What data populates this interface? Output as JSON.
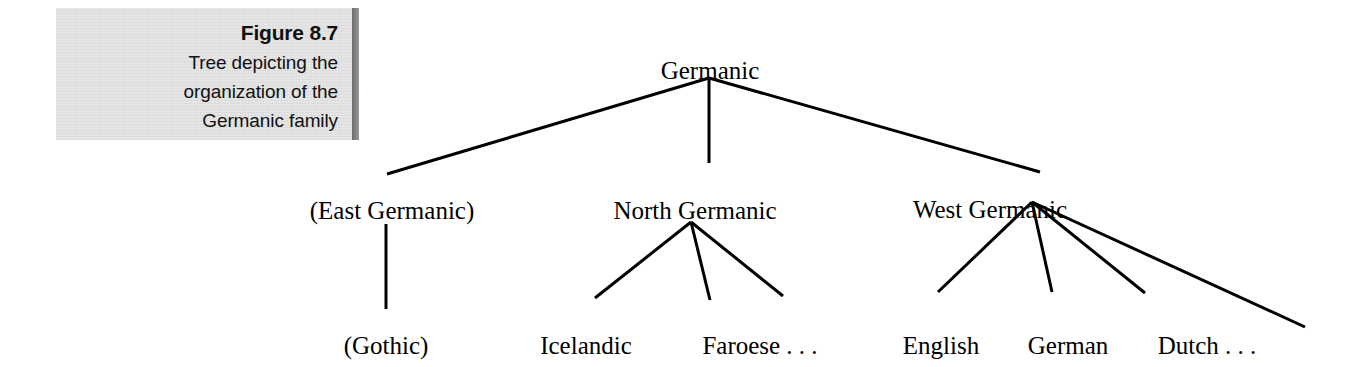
{
  "figure": {
    "caption": {
      "title": "Figure 8.7",
      "lines": [
        "Tree depicting the",
        "organization of the",
        "Germanic family"
      ],
      "panel_color": "#e6e6e6",
      "shadow_color": "#6d6d6d"
    },
    "tree": {
      "line_color": "#000000",
      "text_color": "#000000",
      "nodes": [
        {
          "id": "germanic",
          "label": "Germanic",
          "x": 710,
          "y": 58,
          "level": 0
        },
        {
          "id": "east-germanic",
          "label": "(East Germanic)",
          "x": 392,
          "y": 198,
          "level": 1
        },
        {
          "id": "north-germanic",
          "label": "North Germanic",
          "x": 695,
          "y": 198,
          "level": 1
        },
        {
          "id": "west-germanic",
          "label": "West Germanic",
          "x": 990,
          "y": 197,
          "level": 1
        },
        {
          "id": "gothic",
          "label": "(Gothic)",
          "x": 386,
          "y": 333,
          "level": 2
        },
        {
          "id": "icelandic",
          "label": "Icelandic",
          "x": 586,
          "y": 333,
          "level": 2
        },
        {
          "id": "faroese",
          "label": "Faroese . . .",
          "x": 760,
          "y": 333,
          "level": 2
        },
        {
          "id": "english",
          "label": "English",
          "x": 941,
          "y": 333,
          "level": 2
        },
        {
          "id": "german",
          "label": "German",
          "x": 1068,
          "y": 333,
          "level": 2
        },
        {
          "id": "dutch",
          "label": "Dutch . . .",
          "x": 1207,
          "y": 333,
          "level": 2
        }
      ],
      "edges": [
        {
          "from": "germanic",
          "to": "east-germanic",
          "x1": 709,
          "y1": 78,
          "x2": 387,
          "y2": 174
        },
        {
          "from": "germanic",
          "to": "north-germanic",
          "x1": 709,
          "y1": 78,
          "x2": 709,
          "y2": 163
        },
        {
          "from": "germanic",
          "to": "west-germanic",
          "x1": 709,
          "y1": 78,
          "x2": 1040,
          "y2": 172
        },
        {
          "from": "east-germanic",
          "to": "gothic",
          "x1": 386,
          "y1": 224,
          "x2": 386,
          "y2": 309
        },
        {
          "from": "north-germanic",
          "to": "icelandic",
          "x1": 691,
          "y1": 222,
          "x2": 595,
          "y2": 298
        },
        {
          "from": "north-germanic",
          "to": "unlabeled-north",
          "x1": 691,
          "y1": 222,
          "x2": 710,
          "y2": 300
        },
        {
          "from": "north-germanic",
          "to": "faroese",
          "x1": 691,
          "y1": 222,
          "x2": 783,
          "y2": 296
        },
        {
          "from": "west-germanic",
          "to": "english",
          "x1": 1032,
          "y1": 202,
          "x2": 938,
          "y2": 292
        },
        {
          "from": "west-germanic",
          "to": "german",
          "x1": 1032,
          "y1": 202,
          "x2": 1052,
          "y2": 292
        },
        {
          "from": "west-germanic",
          "to": "dutch",
          "x1": 1032,
          "y1": 202,
          "x2": 1145,
          "y2": 293
        },
        {
          "from": "west-germanic",
          "to": "continuation",
          "x1": 1032,
          "y1": 202,
          "x2": 1305,
          "y2": 327
        }
      ]
    }
  }
}
